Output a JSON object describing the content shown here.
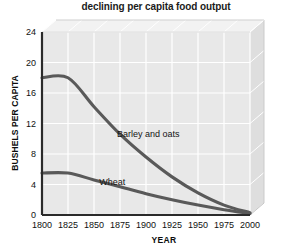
{
  "chart_data": {
    "type": "line",
    "title": "declining per capita food output",
    "xlabel": "YEAR",
    "ylabel": "BUSHELS PER CAPITA",
    "xlim": [
      1800,
      2000
    ],
    "ylim": [
      0,
      24
    ],
    "xticks": [
      "1800",
      "1825",
      "1850",
      "1875",
      "1900",
      "1925",
      "1950",
      "1975",
      "2000"
    ],
    "yticks": [
      "0",
      "4",
      "8",
      "12",
      "16",
      "20",
      "24"
    ],
    "grid": true,
    "legend": "inline-labels",
    "x": [
      1800,
      1825,
      1850,
      1875,
      1900,
      1925,
      1950,
      1975,
      2000
    ],
    "series": [
      {
        "name": "Barley and oats",
        "values": [
          18.0,
          18.0,
          14.2,
          10.6,
          7.6,
          5.0,
          2.9,
          1.3,
          0.3
        ],
        "color": "#595959",
        "label_x": 1872,
        "label_y": 10.2
      },
      {
        "name": "Wheat",
        "values": [
          5.5,
          5.5,
          4.6,
          3.7,
          2.8,
          2.0,
          1.3,
          0.7,
          0.2
        ],
        "color": "#595959",
        "label_x": 1855,
        "label_y": 4.0
      }
    ],
    "colors": {
      "plot_face": "#e8e8e8",
      "plot_top": "#f2f2f2",
      "plot_side": "#dedede",
      "gridline": "#ffffff",
      "axis": "#2b2b2b",
      "line": "#595959",
      "title_text": "#1b1b1b",
      "background": "#ffffff"
    }
  }
}
